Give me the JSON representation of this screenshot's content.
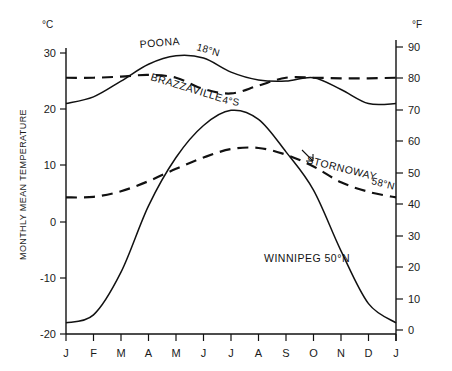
{
  "chart_data": {
    "type": "line",
    "title": "",
    "xlabel": "",
    "ylabel": "MONTHLY MEAN TEMPERATURE",
    "y_unit_left": "°C",
    "y_unit_right": "°F",
    "ylim": [
      -20,
      30
    ],
    "ylim_right": [
      0,
      90
    ],
    "yticks_left": [
      "30",
      "20",
      "10",
      "0",
      "-10",
      "-20"
    ],
    "yticks_left_values": [
      30,
      20,
      10,
      0,
      -10,
      -20
    ],
    "yticks_right": [
      "90",
      "80",
      "70",
      "60",
      "50",
      "40",
      "30",
      "20",
      "10",
      "0"
    ],
    "yticks_right_values": [
      90,
      80,
      70,
      60,
      50,
      40,
      30,
      20,
      10,
      0
    ],
    "categories": [
      "J",
      "F",
      "M",
      "A",
      "M",
      "J",
      "J",
      "A",
      "S",
      "O",
      "N",
      "D",
      "J"
    ],
    "grid": false,
    "legend_position": "inline-annotations",
    "series": [
      {
        "name": "POONA",
        "label": "POONA",
        "latitude": "18°N",
        "style": "solid",
        "values": [
          21.0,
          22.2,
          25.0,
          28.0,
          29.5,
          29.1,
          26.6,
          25.2,
          25.0,
          25.6,
          23.5,
          21.0,
          21.0
        ]
      },
      {
        "name": "BRAZZAVILLE",
        "label": "BRAZZAVILLE",
        "latitude": "4°S",
        "style": "dashed",
        "values": [
          25.6,
          25.6,
          25.8,
          26.1,
          25.6,
          23.6,
          22.8,
          24.2,
          25.6,
          25.6,
          25.5,
          25.5,
          25.6
        ]
      },
      {
        "name": "STORNOWAY",
        "label": "STORNOWAY",
        "latitude": "58°N",
        "style": "dashed",
        "values": [
          4.3,
          4.4,
          5.4,
          7.2,
          9.4,
          11.4,
          12.9,
          13.1,
          11.9,
          9.8,
          7.0,
          5.3,
          4.3
        ]
      },
      {
        "name": "WINNIPEG",
        "label": "WINNIPEG 50°N",
        "latitude": "50°N",
        "style": "solid",
        "values": [
          -18.0,
          -16.6,
          -9.0,
          2.8,
          11.4,
          17.1,
          19.8,
          18.2,
          12.4,
          5.6,
          -5.2,
          -14.6,
          -18.0
        ]
      }
    ],
    "annotations": [
      {
        "text": "POONA 18°N",
        "series": "POONA"
      },
      {
        "text": "BRAZZAVILLE 4°S",
        "series": "BRAZZAVILLE"
      },
      {
        "text": "STORNOWAY 58°N",
        "series": "STORNOWAY",
        "has_leader_line": true
      },
      {
        "text": "WINNIPEG 50°N",
        "series": "WINNIPEG"
      }
    ]
  },
  "labels": {
    "poona_name": "POONA",
    "poona_lat": "18°N",
    "brazzaville_name": "BRAZZAVILLE",
    "brazzaville_lat": "4°S",
    "stornoway_name": "STORNOWAY",
    "stornoway_lat": "58°N",
    "winnipeg_full": "WINNIPEG 50°N",
    "y_axis_title": "MONTHLY MEAN TEMPERATURE",
    "celsius_unit": "°C",
    "fahrenheit_unit": "°F"
  },
  "colors": {
    "ink": "#111111",
    "background": "#ffffff"
  }
}
